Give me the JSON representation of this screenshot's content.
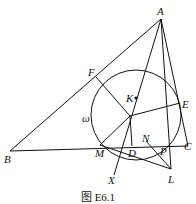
{
  "figure": {
    "caption": "图 E6.1",
    "circle_label": "ω",
    "points": {
      "A": "A",
      "B": "B",
      "C": "C",
      "D": "D",
      "E": "E",
      "F": "F",
      "K": "K",
      "M": "M",
      "N": "N",
      "P": "P",
      "L": "L",
      "X": "X"
    },
    "segments": [
      "AB",
      "BC",
      "CA",
      "AX",
      "AL",
      "FI",
      "EI",
      "ID",
      "MI",
      "ML",
      "NL",
      "MC"
    ]
  }
}
